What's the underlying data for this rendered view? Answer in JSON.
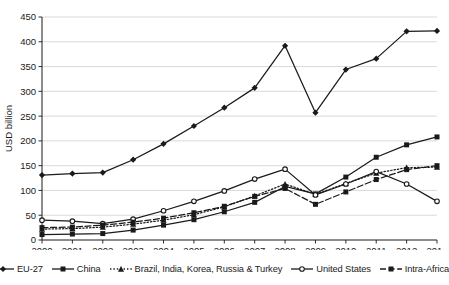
{
  "chart_data": {
    "type": "line",
    "title": "",
    "xlabel": "",
    "ylabel": "USD billion",
    "grid": true,
    "legend_position": "bottom",
    "x": [
      2000,
      2001,
      2002,
      2003,
      2004,
      2005,
      2006,
      2007,
      2008,
      2009,
      2010,
      2011,
      2012,
      2013
    ],
    "xticklabels": [
      "2000",
      "2001",
      "2002",
      "2003",
      "2004",
      "2005",
      "2006",
      "2007",
      "2008",
      "2009",
      "2010",
      "2011",
      "2012",
      "2013"
    ],
    "ylim": [
      0,
      450
    ],
    "yticks": [
      0,
      50,
      100,
      150,
      200,
      250,
      300,
      350,
      400,
      450
    ],
    "yticklabels": [
      "0",
      "50",
      "100",
      "150",
      "200",
      "250",
      "300",
      "350",
      "400",
      "450"
    ],
    "series": [
      {
        "name": "EU-27",
        "style": "solid",
        "marker": "diamond",
        "color": "#1a1a1a",
        "values": [
          131,
          134,
          136,
          162,
          194,
          230,
          267,
          307,
          392,
          257,
          344,
          366,
          421,
          422
        ]
      },
      {
        "name": "China",
        "style": "solid",
        "marker": "square",
        "color": "#1a1a1a",
        "values": [
          11,
          12,
          13,
          20,
          30,
          41,
          57,
          76,
          108,
          93,
          127,
          167,
          192,
          208
        ]
      },
      {
        "name": "Brazil, India, Korea, Russia & Turkey",
        "style": "dotted",
        "marker": "triangle",
        "color": "#1a1a1a",
        "values": [
          22,
          23,
          26,
          32,
          40,
          51,
          67,
          89,
          113,
          92,
          114,
          135,
          146,
          147
        ]
      },
      {
        "name": "United States",
        "style": "solid",
        "marker": "circle",
        "color": "#1a1a1a",
        "values": [
          40,
          38,
          33,
          42,
          59,
          78,
          99,
          123,
          143,
          91,
          113,
          138,
          113,
          78
        ]
      },
      {
        "name": "Intra-Africa",
        "style": "dashed",
        "marker": "square",
        "color": "#1a1a1a",
        "values": [
          25,
          26,
          30,
          36,
          44,
          55,
          68,
          88,
          104,
          72,
          97,
          122,
          142,
          150
        ]
      }
    ]
  },
  "legend": {
    "items": [
      {
        "label": "EU-27"
      },
      {
        "label": "China"
      },
      {
        "label": "Brazil, India, Korea, Russia & Turkey"
      },
      {
        "label": "United States"
      },
      {
        "label": "Intra-Africa"
      }
    ]
  }
}
